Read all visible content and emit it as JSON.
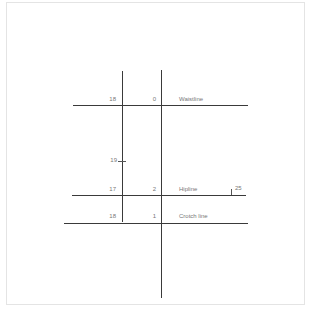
{
  "diagram": {
    "lines": [
      {
        "name": "Waistline",
        "left_value": "18",
        "center_value": "0"
      },
      {
        "name": "Hipline",
        "left_value": "17",
        "center_value": "2",
        "right_value": "25"
      },
      {
        "name": "Crotch line",
        "left_value": "18",
        "center_value": "1"
      }
    ],
    "marks": {
      "left_tick_value": "19"
    },
    "colors": {
      "line": "#3a3a3a",
      "text": "#777777",
      "frame": "#e4e4e4"
    }
  }
}
